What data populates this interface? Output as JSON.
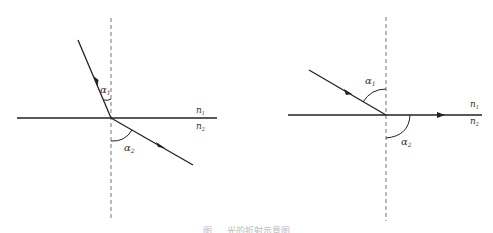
{
  "left_diagram": {
    "description": "refraction from n1 into n2",
    "alpha1": "α",
    "alpha1_sub": "1",
    "alpha2": "α",
    "alpha2_sub": "2",
    "n1": "n",
    "n1_sub": "1",
    "n2": "n",
    "n2_sub": "2"
  },
  "right_diagram": {
    "description": "critical angle / total reflection along interface",
    "alpha1": "α",
    "alpha1_sub": "1",
    "alpha2": "α",
    "alpha2_sub": "2",
    "n1": "n",
    "n1_sub": "1",
    "n2": "n",
    "n2_sub": "2"
  },
  "caption": "图 … 光的折射示意图",
  "colors": {
    "line": "#222222",
    "dashed": "#777777",
    "background": "#ffffff"
  }
}
